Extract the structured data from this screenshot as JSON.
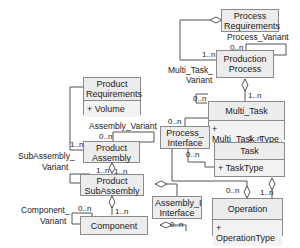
{
  "classes": {
    "process_requirements": {
      "name": "Process Requirements"
    },
    "production_process": {
      "name": "Production Process"
    },
    "multi_task": {
      "name": "Multi_Task",
      "attribute": "+ Multi_Task_Type"
    },
    "process_interface": {
      "name": "Process_ Interface"
    },
    "task": {
      "name": "Task",
      "attribute": "+ TaskType"
    },
    "operation": {
      "name": "Operation",
      "attribute": "+ OperationType"
    },
    "product_requirements": {
      "name": "Product Requirements",
      "attribute": "+ Volume"
    },
    "product_assembly": {
      "name": "Product Assembly"
    },
    "product_subassembly": {
      "name": "Product SubAssembly"
    },
    "assembly_interface": {
      "name": "Assembly_I Interface"
    },
    "component": {
      "name": "Component"
    }
  },
  "labels": {
    "process_variant": "Process_Variant",
    "multi_task_variant_1": "Multi_Task_",
    "multi_task_variant_2": "Variant",
    "assembly_variant": "Assembly_Variant",
    "subassembly_variant_1": "SubAssembly_",
    "subassembly_variant_2": "Variant",
    "component_variant_1": "Component_",
    "component_variant_2": "Variant"
  },
  "multiplicities": {
    "pp_self": "0..n",
    "pr_pp": "1..n",
    "pp_mt": "1..n",
    "mt_self": "0..n",
    "pi_mt": "0..n",
    "mt_task": "1..n",
    "pi_task": "0..n",
    "op_pi": "0..n",
    "task_op": "1..n",
    "pa_self": "0..n",
    "prodreq_pa": "1..n",
    "pa_psa": "1..n",
    "psa_self": "1..n",
    "comp_self": "0..n",
    "psa_comp": "1..n",
    "ai_comp": "0..n"
  }
}
